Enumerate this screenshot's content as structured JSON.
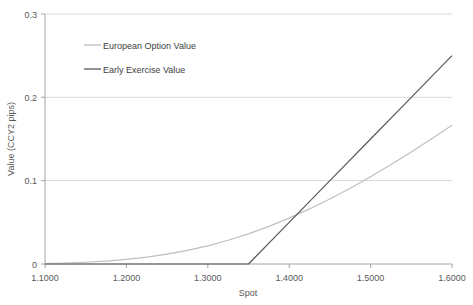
{
  "chart_data": {
    "type": "line",
    "title": "",
    "xlabel": "Spot",
    "ylabel": "Value (CCY2 pips)",
    "xlim": [
      1.1,
      1.6
    ],
    "ylim": [
      0,
      0.3
    ],
    "grid": true,
    "legend_position": "top-left-inside",
    "xticks": [
      "1.1000",
      "1.2000",
      "1.3000",
      "1.4000",
      "1.5000",
      "1.6000"
    ],
    "xtick_values": [
      1.1,
      1.2,
      1.3,
      1.4,
      1.5,
      1.6
    ],
    "yticks": [
      "0",
      "0.1",
      "0.2",
      "0.3"
    ],
    "ytick_values": [
      0,
      0.1,
      0.2,
      0.3
    ],
    "strike": 1.35,
    "series": [
      {
        "name": "European Option Value",
        "color": "#bfbfbf",
        "x": [
          1.1,
          1.125,
          1.15,
          1.175,
          1.2,
          1.225,
          1.25,
          1.275,
          1.3,
          1.325,
          1.35,
          1.375,
          1.4,
          1.425,
          1.45,
          1.475,
          1.5,
          1.525,
          1.55,
          1.575,
          1.6
        ],
        "values": [
          0.0006,
          0.0012,
          0.0021,
          0.0035,
          0.0055,
          0.0082,
          0.0118,
          0.0163,
          0.0218,
          0.0285,
          0.0362,
          0.0451,
          0.0551,
          0.0661,
          0.0781,
          0.091,
          0.1048,
          0.1193,
          0.1345,
          0.1503,
          0.1666
        ]
      },
      {
        "name": "Early Exercise Value",
        "color": "#595959",
        "x": [
          1.1,
          1.15,
          1.2,
          1.25,
          1.3,
          1.35,
          1.4,
          1.45,
          1.5,
          1.55,
          1.6
        ],
        "values": [
          0,
          0,
          0,
          0,
          0,
          0,
          0.05,
          0.1,
          0.15,
          0.2,
          0.25
        ]
      }
    ]
  },
  "legend": {
    "items": [
      {
        "label": "European Option Value",
        "color": "#bfbfbf"
      },
      {
        "label": "Early Exercise Value",
        "color": "#595959"
      }
    ]
  },
  "axes": {
    "x_title": "Spot",
    "y_title": "Value (CCY2 pips)"
  },
  "colors": {
    "european": "#bfbfbf",
    "early_exercise": "#595959",
    "grid": "#d9d9d9",
    "axis": "#a6a6a6",
    "text": "#595959"
  }
}
